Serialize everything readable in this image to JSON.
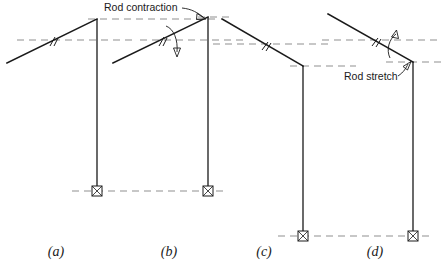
{
  "figure": {
    "background_color": "#ffffff",
    "line_color": "#1a1a1a",
    "reference_line_color": "#8f8f8f",
    "annotations": [
      {
        "id": "rod-contraction",
        "text": "Rod contraction",
        "x": 104,
        "y": 11
      },
      {
        "id": "rod-stretch",
        "text": "Rod stretch",
        "x": 344,
        "y": 80
      }
    ],
    "panels": [
      {
        "id": "a",
        "label": "(a)",
        "label_x": 56,
        "label_y": 256,
        "rod": {
          "x1": 7,
          "y1": 63,
          "x2": 97,
          "y2": 19
        },
        "column": {
          "x": 97,
          "y_top": 19,
          "y_bottom": 191
        },
        "support": {
          "x": 97,
          "y": 191,
          "type": "pin"
        },
        "tick": {
          "x": 53,
          "y": 41
        },
        "reference_lines": [
          {
            "id": "apex-level-a",
            "x1": 88,
            "y1": 19,
            "x2": 218,
            "y2": 19
          },
          {
            "id": "rod-level-a",
            "x1": 17,
            "y1": 40,
            "x2": 135,
            "y2": 40
          },
          {
            "id": "base-level-a",
            "x1": 72,
            "y1": 191,
            "x2": 209,
            "y2": 191
          }
        ]
      },
      {
        "id": "b",
        "label": "(b)",
        "label_x": 169,
        "label_y": 256,
        "rod": {
          "x1": 113,
          "y1": 63,
          "x2": 208,
          "y2": 17
        },
        "column": {
          "x": 208,
          "y_top": 17,
          "y_bottom": 191
        },
        "support": {
          "x": 208,
          "y": 191,
          "type": "pin"
        },
        "tick": {
          "x": 162,
          "y": 41
        },
        "curved_arrow": {
          "id": "contraction-arrow",
          "direction": "down",
          "tip_x": 177,
          "tip_y": 56
        },
        "reference_lines": [
          {
            "id": "rod-level-b",
            "x1": 135,
            "y1": 40,
            "x2": 244,
            "y2": 40
          },
          {
            "id": "apex-level-b",
            "x1": 199,
            "y1": 17,
            "x2": 230,
            "y2": 17
          }
        ]
      },
      {
        "id": "c",
        "label": "(c)",
        "label_x": 264,
        "label_y": 256,
        "rod": {
          "x1": 222,
          "y1": 19,
          "x2": 303,
          "y2": 66
        },
        "column": {
          "x": 303,
          "y_top": 66,
          "y_bottom": 236
        },
        "support": {
          "x": 303,
          "y": 236,
          "type": "pin"
        },
        "tick": {
          "x": 266,
          "y": 45
        },
        "reference_lines": [
          {
            "id": "rod-level-c",
            "x1": 215,
            "y1": 44,
            "x2": 330,
            "y2": 44
          },
          {
            "id": "apex-level-c",
            "x1": 292,
            "y1": 66,
            "x2": 420,
            "y2": 66
          },
          {
            "id": "base-level-c",
            "x1": 278,
            "y1": 236,
            "x2": 424,
            "y2": 236
          }
        ]
      },
      {
        "id": "d",
        "label": "(d)",
        "label_x": 375,
        "label_y": 256,
        "rod": {
          "x1": 328,
          "y1": 14,
          "x2": 413,
          "y2": 62
        },
        "column": {
          "x": 413,
          "y_top": 62,
          "y_bottom": 236
        },
        "support": {
          "x": 413,
          "y": 236,
          "type": "pin"
        },
        "tick": {
          "x": 376,
          "y": 41
        },
        "curved_arrow": {
          "id": "stretch-arrow",
          "direction": "up",
          "tip_x": 395,
          "tip_y": 33
        },
        "reference_lines": [
          {
            "id": "rod-level-d",
            "x1": 322,
            "y1": 40,
            "x2": 442,
            "y2": 40
          },
          {
            "id": "apex-level-d",
            "x1": 389,
            "y1": 62,
            "x2": 442,
            "y2": 62
          },
          {
            "id": "base-level-d",
            "x1": 398,
            "y1": 236,
            "x2": 442,
            "y2": 236
          }
        ]
      }
    ]
  }
}
